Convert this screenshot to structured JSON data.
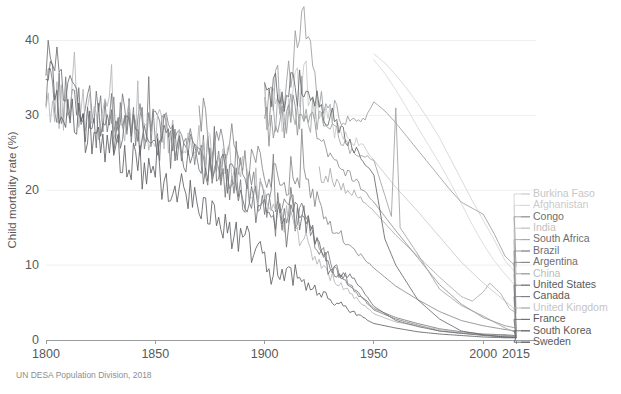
{
  "chart_data": {
    "type": "line",
    "title": "",
    "xlabel": "",
    "ylabel": "Child mortality rate (%)",
    "xlim": [
      1800,
      2015
    ],
    "ylim": [
      0,
      43
    ],
    "grid": true,
    "legend_position": "right",
    "source": "UN DESA Population Division, 2018",
    "xticks": [
      "1800",
      "1850",
      "1900",
      "1950",
      "2000",
      "2015"
    ],
    "xtick_values": [
      1800,
      1850,
      1900,
      1950,
      2000,
      2015
    ],
    "yticks": [
      "0",
      "10",
      "20",
      "30",
      "40"
    ],
    "ytick_values": [
      0,
      10,
      20,
      30,
      40
    ],
    "series": [
      {
        "name": "Burkina Faso",
        "color": "#d2d3d4",
        "label_color": "#c6c7c8",
        "x": [
          1950,
          1955,
          1960,
          1965,
          1970,
          1975,
          1980,
          1985,
          1990,
          1995,
          2000,
          2005,
          2010,
          2015
        ],
        "values": [
          38.2,
          37.0,
          35.4,
          33.6,
          31.6,
          29.4,
          27.0,
          24.2,
          21.4,
          18.6,
          16.0,
          13.4,
          10.6,
          8.9
        ]
      },
      {
        "name": "Afghanistan",
        "color": "#d6d7d8",
        "label_color": "#cacbcc",
        "x": [
          1950,
          1955,
          1960,
          1965,
          1970,
          1975,
          1980,
          1985,
          1990,
          1995,
          2000,
          2005,
          2010,
          2015
        ],
        "values": [
          37.4,
          35.6,
          33.4,
          31.0,
          28.4,
          26.0,
          23.6,
          21.0,
          18.2,
          15.4,
          12.8,
          10.6,
          8.8,
          7.1
        ]
      },
      {
        "name": "Congo",
        "color": "#9a9b9d",
        "label_color": "#6d6e70",
        "x": [
          1900,
          1910,
          1918,
          1925,
          1935,
          1945,
          1950,
          1955,
          1960,
          1965,
          1970,
          1975,
          1980,
          1985,
          1990,
          1995,
          2000,
          2005,
          2010,
          2015
        ],
        "values": [
          32.0,
          33.5,
          42.8,
          31.5,
          30.0,
          29.2,
          31.8,
          30.6,
          29.0,
          27.2,
          25.4,
          23.6,
          21.8,
          20.0,
          18.4,
          17.6,
          16.8,
          14.2,
          11.2,
          9.8
        ]
      },
      {
        "name": "India",
        "color": "#c6c7c8",
        "label_color": "#c0c1c2",
        "x": [
          1900,
          1910,
          1918,
          1925,
          1935,
          1945,
          1950,
          1960,
          1970,
          1980,
          1990,
          2000,
          2010,
          2015
        ],
        "values": [
          31.0,
          30.2,
          35.5,
          29.4,
          27.2,
          25.8,
          24.0,
          20.4,
          17.2,
          13.8,
          10.4,
          7.6,
          5.2,
          4.0
        ]
      },
      {
        "name": "South Africa",
        "color": "#a8a9ab",
        "label_color": "#6d6e70",
        "x": [
          1925,
          1935,
          1945,
          1950,
          1960,
          1970,
          1980,
          1990,
          1995,
          2000,
          2003,
          2008,
          2012,
          2015
        ],
        "values": [
          22.5,
          20.8,
          18.6,
          17.2,
          14.0,
          11.2,
          8.4,
          5.8,
          5.2,
          6.4,
          7.6,
          6.2,
          4.2,
          3.6
        ]
      },
      {
        "name": "Brazil",
        "color": "#8e8f91",
        "label_color": "#6d6e70",
        "x": [
          1900,
          1918,
          1930,
          1940,
          1950,
          1960,
          1970,
          1980,
          1990,
          2000,
          2010,
          2015
        ],
        "values": [
          28.5,
          30.2,
          24.6,
          21.8,
          18.4,
          14.6,
          11.0,
          7.4,
          4.8,
          3.0,
          1.9,
          1.6
        ]
      },
      {
        "name": "Argentina",
        "color": "#86878a",
        "label_color": "#6d6e70",
        "x": [
          1870,
          1890,
          1900,
          1918,
          1930,
          1940,
          1950,
          1960,
          1970,
          1980,
          1990,
          2000,
          2010,
          2015
        ],
        "values": [
          28.0,
          25.0,
          22.4,
          21.8,
          15.6,
          12.4,
          9.6,
          7.2,
          5.4,
          3.8,
          2.6,
          1.9,
          1.4,
          1.2
        ]
      },
      {
        "name": "China",
        "color": "#9fa0a2",
        "label_color": "#bcbdbe",
        "x": [
          1900,
          1918,
          1930,
          1940,
          1950,
          1958,
          1960,
          1962,
          1970,
          1980,
          1990,
          2000,
          2010,
          2015
        ],
        "values": [
          30.5,
          31.0,
          28.0,
          25.5,
          24.0,
          16.5,
          31.0,
          15.0,
          11.5,
          6.8,
          4.6,
          3.2,
          1.6,
          1.0
        ]
      },
      {
        "name": "United States",
        "color": "#76777a",
        "label_color": "#58595b",
        "x": [
          1800,
          1820,
          1840,
          1860,
          1880,
          1900,
          1918,
          1930,
          1940,
          1950,
          1960,
          1970,
          1980,
          1990,
          2000,
          2010,
          2015
        ],
        "values": [
          33.0,
          31.5,
          29.0,
          26.5,
          22.0,
          17.5,
          16.0,
          10.0,
          7.2,
          4.2,
          3.0,
          2.2,
          1.5,
          1.1,
          0.8,
          0.7,
          0.6
        ]
      },
      {
        "name": "Canada",
        "color": "#7e7f82",
        "label_color": "#58595b",
        "x": [
          1830,
          1850,
          1870,
          1890,
          1900,
          1918,
          1930,
          1940,
          1950,
          1960,
          1970,
          1980,
          1990,
          2000,
          2010,
          2015
        ],
        "values": [
          30.0,
          27.5,
          25.0,
          21.5,
          19.0,
          16.5,
          10.5,
          7.0,
          4.0,
          2.8,
          2.0,
          1.2,
          0.9,
          0.7,
          0.6,
          0.5
        ]
      },
      {
        "name": "United Kingdom",
        "color": "#b4b5b7",
        "label_color": "#c4c5c6",
        "x": [
          1800,
          1820,
          1840,
          1860,
          1880,
          1900,
          1918,
          1930,
          1940,
          1950,
          1960,
          1970,
          1980,
          1990,
          2000,
          2010,
          2015
        ],
        "values": [
          32.5,
          30.0,
          28.5,
          27.0,
          24.5,
          19.5,
          13.5,
          8.5,
          6.0,
          3.5,
          2.4,
          1.9,
          1.4,
          1.0,
          0.7,
          0.5,
          0.4
        ]
      },
      {
        "name": "France",
        "color": "#6e6f72",
        "label_color": "#58595b",
        "x": [
          1800,
          1820,
          1840,
          1860,
          1880,
          1900,
          1918,
          1930,
          1940,
          1950,
          1960,
          1970,
          1980,
          1990,
          2000,
          2010,
          2015
        ],
        "values": [
          38.5,
          29.0,
          27.5,
          25.5,
          22.5,
          17.0,
          16.5,
          9.0,
          8.5,
          4.5,
          2.6,
          1.8,
          1.2,
          0.9,
          0.6,
          0.4,
          0.4
        ]
      },
      {
        "name": "South Korea",
        "color": "#66676a",
        "label_color": "#58595b",
        "x": [
          1900,
          1918,
          1930,
          1940,
          1950,
          1955,
          1960,
          1970,
          1980,
          1990,
          2000,
          2010,
          2015
        ],
        "values": [
          33.0,
          33.5,
          30.0,
          26.0,
          22.0,
          13.5,
          10.0,
          5.4,
          2.8,
          1.2,
          0.7,
          0.4,
          0.3
        ]
      },
      {
        "name": "Sweden",
        "color": "#5f6063",
        "label_color": "#58595b",
        "x": [
          1800,
          1810,
          1820,
          1830,
          1840,
          1850,
          1860,
          1870,
          1880,
          1890,
          1900,
          1918,
          1930,
          1940,
          1950,
          1960,
          1970,
          1980,
          1990,
          2000,
          2010,
          2015
        ],
        "values": [
          35.0,
          30.0,
          27.5,
          26.0,
          24.0,
          21.5,
          20.0,
          18.5,
          15.5,
          13.0,
          11.0,
          7.5,
          5.5,
          3.8,
          2.2,
          1.6,
          1.1,
          0.8,
          0.6,
          0.4,
          0.3,
          0.3
        ]
      }
    ]
  },
  "legend": {
    "items": [
      "Burkina Faso",
      "Afghanistan",
      "Congo",
      "India",
      "South Africa",
      "Brazil",
      "Argentina",
      "China",
      "United States",
      "Canada",
      "United Kingdom",
      "France",
      "South Korea",
      "Sweden"
    ]
  }
}
